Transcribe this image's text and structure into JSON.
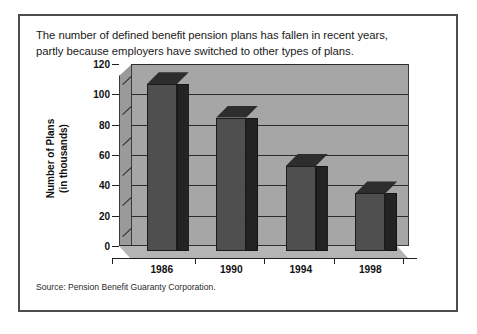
{
  "figure": {
    "caption_lines": [
      "The number of defined benefit pension plans has fallen in recent years,",
      "partly because employers have switched to other types of plans."
    ],
    "source_note": "Source:  Pension Benefit Guaranty Corporation."
  },
  "chart_data": {
    "type": "bar",
    "title": "",
    "subtitle": "",
    "categories": [
      "1986",
      "1990",
      "1994",
      "1998"
    ],
    "values": [
      110,
      88,
      56,
      38
    ],
    "xlabel": "",
    "ylabel_lines": [
      "Number of Plans",
      "(in thousands)"
    ],
    "ylabel": "Number of Plans (in thousands)",
    "ylim": [
      0,
      120
    ],
    "ytick_values": [
      0,
      20,
      40,
      60,
      80,
      100,
      120
    ],
    "ytick_labels": [
      "0",
      "20",
      "40",
      "60",
      "80",
      "100",
      "120"
    ],
    "grid": "horizontal",
    "legend": "none",
    "style": "3d-column",
    "colors": {
      "bar_front": "#4f4f4f",
      "bar_side": "#232323",
      "bar_top": "#2d2d2d",
      "plot_wall": "#a6a6a6",
      "plot_floor": "#b4b4b4",
      "gridline": "#2b2b2b",
      "frame_border": "#4d4d4d",
      "background": "#ffffff",
      "text": "#111111"
    }
  }
}
